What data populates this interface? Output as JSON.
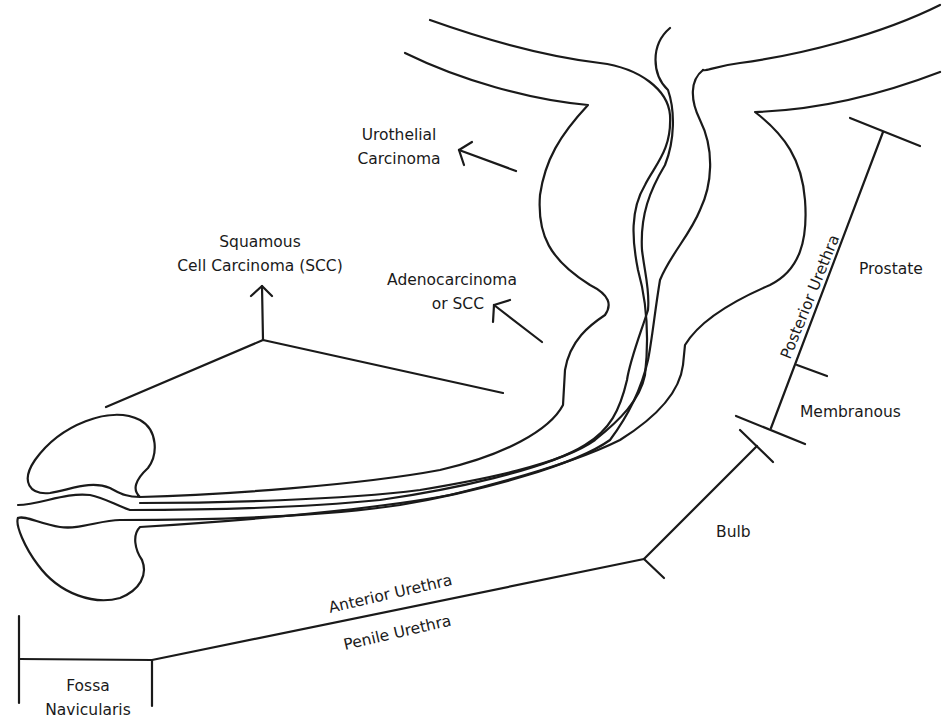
{
  "diagram": {
    "colors": {
      "line": "#1a1a1a",
      "background": "#ffffff"
    },
    "tumor_labels": {
      "urothelial": [
        "Urothelial",
        "Carcinoma"
      ],
      "squamous": [
        "Squamous",
        "Cell Carcinoma (SCC)"
      ],
      "adeno": [
        "Adenocarcinoma",
        "or SCC"
      ]
    },
    "segment_labels": {
      "prostate": "Prostate",
      "posterior_urethra": "Posterior Urethra",
      "membranous": "Membranous",
      "bulb": "Bulb",
      "anterior_urethra": "Anterior Urethra",
      "penile_urethra": "Penile Urethra",
      "fossa": [
        "Fossa",
        "Navicularis"
      ]
    }
  }
}
